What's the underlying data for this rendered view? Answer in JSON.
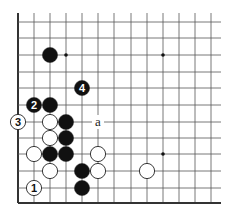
{
  "diagram": {
    "type": "go-board-fragment",
    "grid": {
      "columns_x": [
        18,
        34,
        50,
        66,
        82,
        98,
        114,
        131,
        147,
        163,
        179,
        195,
        211
      ],
      "rows_y": [
        22,
        38,
        55,
        72,
        88,
        105,
        122,
        138,
        154,
        171,
        188,
        203
      ],
      "top_open_y": 13,
      "right_open_x": 221,
      "left_edge": true,
      "bottom_edge": true
    },
    "colors": {
      "line": "#555555",
      "edge": "#333333",
      "black": "#111111",
      "white": "#ffffff"
    },
    "star_points": [
      {
        "c": 3,
        "r": 2
      },
      {
        "c": 9,
        "r": 2
      },
      {
        "c": 9,
        "r": 8
      }
    ],
    "stones": [
      {
        "color": "black",
        "c": 2,
        "r": 2,
        "label": ""
      },
      {
        "color": "black",
        "c": 4,
        "r": 4,
        "label": "4"
      },
      {
        "color": "black",
        "c": 1,
        "r": 5,
        "label": "2"
      },
      {
        "color": "black",
        "c": 2,
        "r": 5,
        "label": ""
      },
      {
        "color": "white",
        "c": 0,
        "r": 6,
        "label": "3"
      },
      {
        "color": "white",
        "c": 2,
        "r": 6,
        "label": ""
      },
      {
        "color": "black",
        "c": 3,
        "r": 6,
        "label": ""
      },
      {
        "color": "white",
        "c": 2,
        "r": 7,
        "label": ""
      },
      {
        "color": "black",
        "c": 3,
        "r": 7,
        "label": ""
      },
      {
        "color": "white",
        "c": 1,
        "r": 8,
        "label": ""
      },
      {
        "color": "black",
        "c": 2,
        "r": 8,
        "label": ""
      },
      {
        "color": "black",
        "c": 3,
        "r": 8,
        "label": ""
      },
      {
        "color": "white",
        "c": 5,
        "r": 8,
        "label": ""
      },
      {
        "color": "white",
        "c": 2,
        "r": 9,
        "label": ""
      },
      {
        "color": "black",
        "c": 4,
        "r": 9,
        "label": ""
      },
      {
        "color": "white",
        "c": 5,
        "r": 9,
        "label": ""
      },
      {
        "color": "white",
        "c": 8,
        "r": 9,
        "label": ""
      },
      {
        "color": "white",
        "c": 1,
        "r": 10,
        "label": "1"
      },
      {
        "color": "black",
        "c": 4,
        "r": 10,
        "label": ""
      }
    ],
    "markers": [
      {
        "c": 5,
        "r": 6,
        "text": "a"
      }
    ]
  }
}
